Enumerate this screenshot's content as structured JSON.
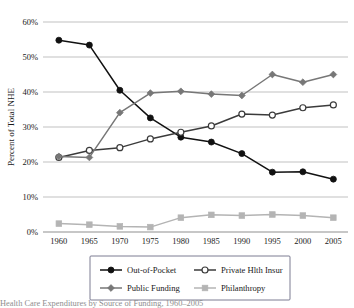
{
  "chart_data": {
    "type": "line",
    "title": "",
    "xlabel": "",
    "ylabel": "Percent of Total NHE",
    "categories": [
      "1960",
      "1965",
      "1970",
      "1975",
      "1980",
      "1985",
      "1990",
      "1995",
      "2000",
      "2005"
    ],
    "x": [
      1960,
      1965,
      1970,
      1975,
      1980,
      1985,
      1990,
      1995,
      2000,
      2005
    ],
    "ylim": [
      0,
      60
    ],
    "yticks": [
      0,
      10,
      20,
      30,
      40,
      50,
      60
    ],
    "ytick_labels": [
      "0%",
      "10%",
      "20%",
      "30%",
      "40%",
      "50%",
      "60%"
    ],
    "grid": true,
    "legend_position": "bottom",
    "series": [
      {
        "name": "Out-of-Pocket",
        "marker": "filled-circle",
        "color": "#111111",
        "values": [
          54.8,
          53.4,
          40.5,
          32.6,
          27.1,
          25.7,
          22.4,
          17.1,
          17.2,
          15.1
        ]
      },
      {
        "name": "Private Hlth Insur",
        "marker": "hollow-circle",
        "color": "#3b3b3b",
        "values": [
          21.3,
          23.3,
          24.1,
          26.6,
          28.5,
          30.3,
          33.7,
          33.4,
          35.5,
          36.3
        ]
      },
      {
        "name": "Public Funding",
        "marker": "filled-diamond",
        "color": "#777777",
        "values": [
          21.6,
          21.3,
          34.1,
          39.7,
          40.2,
          39.4,
          39.0,
          45.0,
          42.8,
          45.0
        ]
      },
      {
        "name": "Philanthropy",
        "marker": "filled-square",
        "color": "#b4b4b4",
        "values": [
          2.4,
          2.1,
          1.6,
          1.4,
          4.1,
          4.9,
          4.7,
          5.0,
          4.7,
          4.1
        ]
      }
    ]
  },
  "caption": {
    "text": "Health Care Expenditures by Source of Funding, 1960–2005"
  }
}
